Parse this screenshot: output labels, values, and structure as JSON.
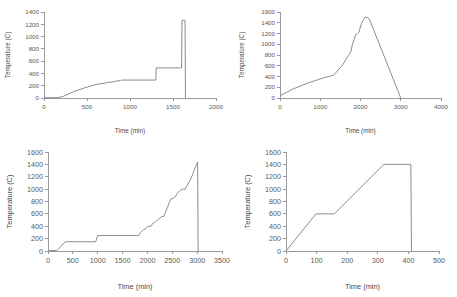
{
  "figure": {
    "panel_count": 4,
    "line_color": "#8c8c8c",
    "axis_color": "#9a9a9a",
    "background": "#ffffff"
  },
  "chart_data": [
    {
      "id": "top-left",
      "type": "line",
      "title": "",
      "xlabel": "Time (min)",
      "ylabel": "Temperature (C)",
      "xlim": [
        0,
        2000
      ],
      "ylim": [
        0,
        1400
      ],
      "xticks": [
        0,
        500,
        1000,
        1500,
        2000
      ],
      "yticks": [
        0,
        200,
        400,
        600,
        800,
        1000,
        1200,
        1400
      ],
      "grid": false,
      "legend": "none",
      "series": [
        {
          "name": "thermal-profile",
          "x": [
            0,
            160,
            230,
            330,
            470,
            620,
            700,
            740,
            790,
            840,
            890,
            900,
            1300,
            1305,
            1600,
            1605,
            1640,
            1645,
            1650
          ],
          "y": [
            5,
            5,
            30,
            95,
            165,
            225,
            240,
            255,
            260,
            275,
            285,
            292,
            292,
            490,
            490,
            1265,
            1265,
            0,
            0
          ]
        }
      ]
    },
    {
      "id": "top-right",
      "type": "line",
      "title": "",
      "xlabel": "Time (min)",
      "ylabel": "Temperature (C)",
      "xlim": [
        0,
        4000
      ],
      "ylim": [
        0,
        1600
      ],
      "xticks": [
        0,
        1000,
        2000,
        3000,
        4000
      ],
      "yticks": [
        0,
        200,
        400,
        600,
        800,
        1000,
        1200,
        1400,
        1600
      ],
      "grid": false,
      "legend": "none",
      "series": [
        {
          "name": "thermal-profile",
          "x": [
            0,
            300,
            700,
            1100,
            1290,
            1340,
            1560,
            1700,
            1760,
            1800,
            1880,
            1930,
            1960,
            2020,
            2060,
            2110,
            2180,
            2230,
            3000
          ],
          "y": [
            40,
            160,
            280,
            380,
            415,
            430,
            620,
            790,
            860,
            1000,
            1180,
            1200,
            1220,
            1380,
            1440,
            1500,
            1500,
            1450,
            0
          ]
        }
      ]
    },
    {
      "id": "bottom-left",
      "type": "line",
      "title": "",
      "xlabel": "Time (min)",
      "ylabel": "Temperature (C)",
      "xlim": [
        0,
        3500
      ],
      "ylim": [
        0,
        1600
      ],
      "xticks": [
        0,
        500,
        1000,
        1500,
        2000,
        2500,
        3000,
        3500
      ],
      "yticks": [
        0,
        200,
        400,
        600,
        800,
        1000,
        1200,
        1400,
        1600
      ],
      "grid": false,
      "legend": "none",
      "series": [
        {
          "name": "thermal-profile",
          "x": [
            0,
            180,
            350,
            960,
            1000,
            1820,
            1860,
            1900,
            1960,
            2010,
            2070,
            2100,
            2150,
            2200,
            2250,
            2290,
            2330,
            2360,
            2400,
            2430,
            2470,
            2520,
            2560,
            2600,
            2660,
            2700,
            2760,
            2800,
            2840,
            2880,
            2920,
            2950,
            2990,
            3010,
            3020,
            3030
          ],
          "y": [
            5,
            10,
            150,
            150,
            250,
            250,
            300,
            330,
            360,
            400,
            400,
            440,
            460,
            500,
            530,
            560,
            560,
            620,
            700,
            760,
            840,
            850,
            880,
            930,
            980,
            1000,
            1000,
            1060,
            1120,
            1180,
            1260,
            1330,
            1400,
            1440,
            0,
            0
          ]
        }
      ]
    },
    {
      "id": "bottom-right",
      "type": "line",
      "title": "",
      "xlabel": "Time (min)",
      "ylabel": "Temperature (C)",
      "xlim": [
        0,
        500
      ],
      "ylim": [
        0,
        1600
      ],
      "xticks": [
        0,
        100,
        200,
        300,
        400,
        500
      ],
      "yticks": [
        0,
        200,
        400,
        600,
        800,
        1000,
        1200,
        1400,
        1600
      ],
      "grid": false,
      "legend": "none",
      "series": [
        {
          "name": "thermal-profile",
          "x": [
            0,
            98,
            158,
            320,
            408,
            410
          ],
          "y": [
            0,
            600,
            600,
            1400,
            1400,
            0
          ]
        }
      ]
    }
  ]
}
